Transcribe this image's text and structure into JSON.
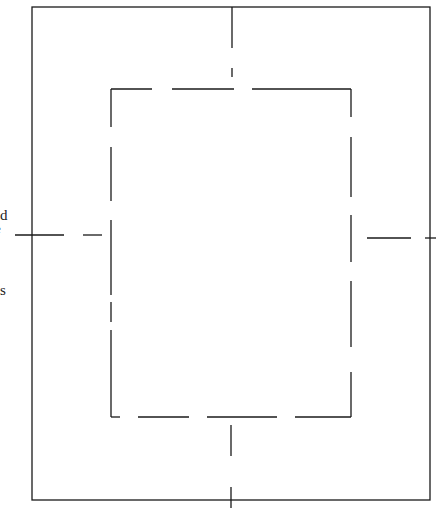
{
  "diagram": {
    "stroke_color": "#1a1a1a",
    "outer_rectangle": {
      "style": "solid"
    },
    "inner_rectangle": {
      "style": "long-dash"
    },
    "center_lines": {
      "style": "dash"
    }
  },
  "text_fragments": [
    {
      "id": "frag-1",
      "text": "d"
    },
    {
      "id": "frag-2",
      "text": "e"
    },
    {
      "id": "frag-3",
      "text": "s"
    }
  ]
}
